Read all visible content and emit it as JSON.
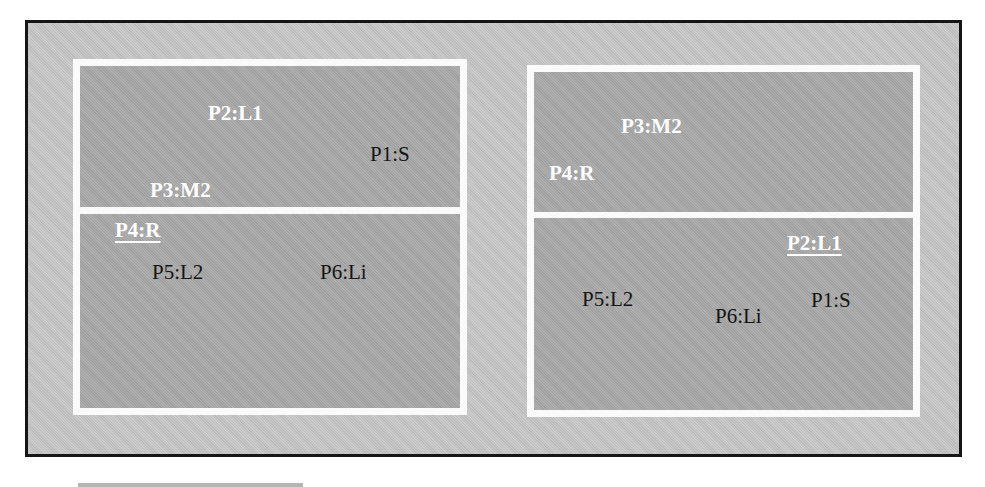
{
  "diagram": {
    "colors": {
      "outer_background": "#c6c6c6",
      "outer_border": "#151515",
      "panel_frame": "#fafafa",
      "section_fill": "#a9a9a9",
      "active_label": "#ffffff",
      "inactive_label": "#141414"
    },
    "left_panel": {
      "top_section": {
        "labels": [
          {
            "text": "P2:L1",
            "style": "bold-white"
          },
          {
            "text": "P1:S",
            "style": "normal-black"
          },
          {
            "text": "P3:M2",
            "style": "bold-white"
          }
        ]
      },
      "bottom_section": {
        "labels": [
          {
            "text": "P4:R",
            "style": "bold-white-underlined"
          },
          {
            "text": "P5:L2",
            "style": "normal-black"
          },
          {
            "text": "P6:Li",
            "style": "normal-black"
          }
        ]
      }
    },
    "right_panel": {
      "top_section": {
        "labels": [
          {
            "text": "P3:M2",
            "style": "bold-white"
          },
          {
            "text": "P4:R",
            "style": "bold-white"
          }
        ]
      },
      "bottom_section": {
        "labels": [
          {
            "text": "P2:L1",
            "style": "bold-white-underlined"
          },
          {
            "text": "P5:L2",
            "style": "normal-black"
          },
          {
            "text": "P1:S",
            "style": "normal-black"
          },
          {
            "text": "P6:Li",
            "style": "normal-black"
          }
        ]
      }
    }
  }
}
